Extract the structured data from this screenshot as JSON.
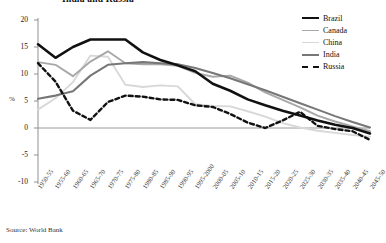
{
  "chart_title": "India and Russia",
  "source_note": "Source: World Bank",
  "axes": {
    "ylabel": "%",
    "yticks": [
      20,
      15,
      10,
      5,
      0,
      -5,
      -10
    ],
    "ylim": [
      -10,
      20
    ],
    "xlabel": "",
    "grid": false,
    "zero_line": true
  },
  "legend": {
    "position": "right",
    "entries": [
      {
        "label": "Brazil",
        "color": "#111111",
        "width": 2.6,
        "dash": "none"
      },
      {
        "label": "Canada",
        "color": "#a8a8a8",
        "width": 1.9,
        "dash": "none"
      },
      {
        "label": "China",
        "color": "#d8d8d8",
        "width": 1.9,
        "dash": "none"
      },
      {
        "label": "India",
        "color": "#777777",
        "width": 2.1,
        "dash": "none"
      },
      {
        "label": "Russia",
        "color": "#111111",
        "width": 2.4,
        "dash": "4 3"
      }
    ]
  },
  "chart_data": {
    "type": "line",
    "title": "India and Russia",
    "xlabel": "",
    "ylabel": "%",
    "ylim": [
      -10,
      20
    ],
    "yticks": [
      20,
      15,
      10,
      5,
      0,
      -5,
      -10
    ],
    "grid": false,
    "legend_position": "right",
    "categories": [
      "1950-55",
      "1955-60",
      "1960-65",
      "1965-70",
      "1970-75",
      "1975-80",
      "1980-85",
      "1985-90",
      "1990-95",
      "1995-2000",
      "2000-05",
      "2005-10",
      "2010-15",
      "2015-20",
      "2020-25",
      "2025-30",
      "2030-35",
      "2035-40",
      "2040-45",
      "2045-50"
    ],
    "series": [
      {
        "name": "Brazil",
        "color": "#111111",
        "values": [
          15.5,
          13.0,
          15.0,
          16.4,
          16.4,
          16.4,
          14.0,
          12.6,
          11.6,
          10.5,
          8.2,
          6.9,
          5.3,
          4.2,
          3.2,
          2.3,
          1.4,
          0.6,
          0.0,
          -1.0
        ]
      },
      {
        "name": "Canada",
        "color": "#a8a8a8",
        "values": [
          12.2,
          11.7,
          9.6,
          12.3,
          14.2,
          12.0,
          11.8,
          11.8,
          11.5,
          10.2,
          9.5,
          9.7,
          8.4,
          6.6,
          5.2,
          3.8,
          2.3,
          1.2,
          0.3,
          -0.6
        ]
      },
      {
        "name": "China",
        "color": "#d8d8d8",
        "values": [
          3.4,
          5.5,
          8.5,
          13.4,
          13.2,
          8.0,
          7.6,
          7.9,
          7.7,
          4.4,
          4.1,
          4.0,
          3.1,
          2.1,
          0.9,
          0.1,
          -0.5,
          -0.9,
          -1.3,
          -1.6
        ]
      },
      {
        "name": "India",
        "color": "#777777",
        "values": [
          5.4,
          6.0,
          6.8,
          9.7,
          11.7,
          12.0,
          12.2,
          12.0,
          11.8,
          11.1,
          10.2,
          9.2,
          8.1,
          7.0,
          5.8,
          4.6,
          3.4,
          2.2,
          1.1,
          0.1
        ]
      },
      {
        "name": "Russia",
        "color": "#111111",
        "dash": "4 3",
        "values": [
          12.0,
          8.6,
          3.2,
          1.5,
          4.8,
          6.0,
          5.8,
          5.3,
          5.2,
          4.2,
          3.9,
          2.6,
          1.0,
          0.0,
          1.4,
          3.0,
          0.4,
          -0.2,
          -0.6,
          -2.2
        ]
      }
    ]
  }
}
